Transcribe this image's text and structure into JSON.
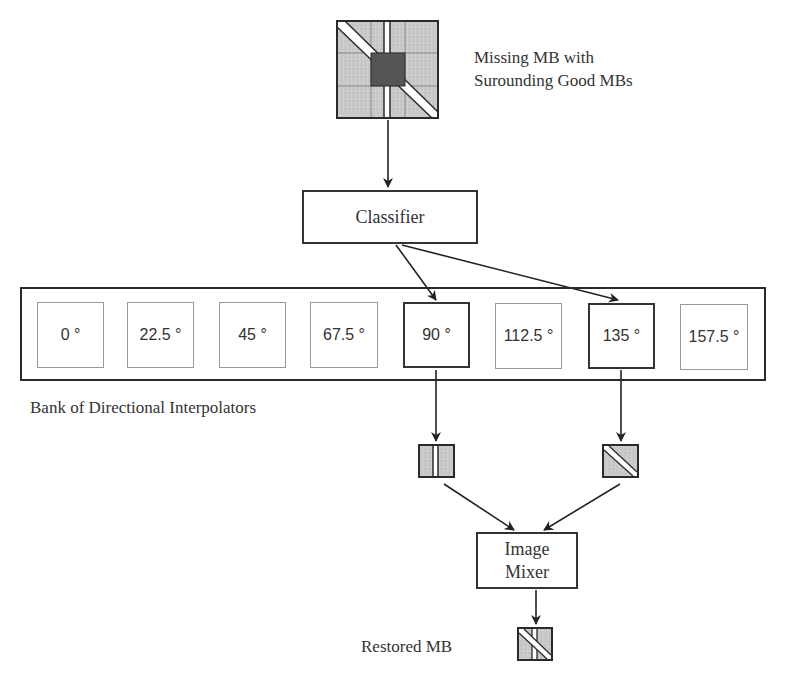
{
  "input_block": {
    "caption_line1": "Missing MB with",
    "caption_line2": "Surounding Good MBs"
  },
  "classifier": {
    "label": "Classifier"
  },
  "bank": {
    "label": "Bank of Directional Interpolators",
    "interpolators": [
      {
        "label": "0 °",
        "active": false
      },
      {
        "label": "22.5 °",
        "active": false
      },
      {
        "label": "45 °",
        "active": false
      },
      {
        "label": "67.5 °",
        "active": false
      },
      {
        "label": "90 °",
        "active": true
      },
      {
        "label": "112.5 °",
        "active": false
      },
      {
        "label": "135 °",
        "active": true
      },
      {
        "label": "157.5 °",
        "active": false
      }
    ]
  },
  "intermediate_outputs": [
    {
      "direction": "90 °",
      "icon": "vertical-edge-block-icon"
    },
    {
      "direction": "135 °",
      "icon": "diagonal-edge-block-icon"
    }
  ],
  "mixer": {
    "label_line1": "Image",
    "label_line2": "Mixer"
  },
  "output": {
    "label": "Restored MB"
  },
  "colors": {
    "block_fill": "#c8c8c8",
    "missing_block_fill": "#555555",
    "stroke": "#2a2a2a",
    "inactive_border": "#999999"
  }
}
